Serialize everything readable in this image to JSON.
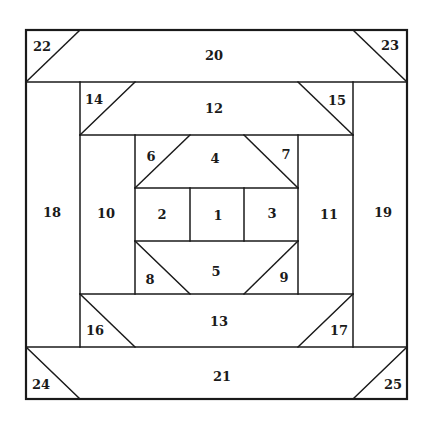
{
  "diagram": {
    "frame": {
      "x": 26,
      "y": 30,
      "width": 381,
      "height": 369
    },
    "colors": {
      "line": "#1a1a1a",
      "background": "#ffffff",
      "label": "#1a1a1a"
    },
    "grid": {
      "x": [
        26,
        80,
        135,
        190,
        244,
        298,
        353,
        407
      ],
      "y": [
        30,
        82,
        135,
        188,
        241,
        294,
        347,
        399
      ]
    },
    "lines": [
      {
        "id": "h-row1",
        "x1": 26,
        "y1": 82,
        "x2": 407,
        "y2": 82
      },
      {
        "id": "h-row2",
        "x1": 80,
        "y1": 135,
        "x2": 353,
        "y2": 135
      },
      {
        "id": "h-row3",
        "x1": 135,
        "y1": 188,
        "x2": 298,
        "y2": 188
      },
      {
        "id": "h-row4",
        "x1": 135,
        "y1": 241,
        "x2": 298,
        "y2": 241
      },
      {
        "id": "h-row5",
        "x1": 80,
        "y1": 294,
        "x2": 353,
        "y2": 294
      },
      {
        "id": "h-row6",
        "x1": 26,
        "y1": 347,
        "x2": 407,
        "y2": 347
      },
      {
        "id": "v-col1",
        "x1": 80,
        "y1": 82,
        "x2": 80,
        "y2": 347
      },
      {
        "id": "v-col2",
        "x1": 135,
        "y1": 135,
        "x2": 135,
        "y2": 294
      },
      {
        "id": "v-col3",
        "x1": 190,
        "y1": 188,
        "x2": 190,
        "y2": 241
      },
      {
        "id": "v-col4",
        "x1": 244,
        "y1": 188,
        "x2": 244,
        "y2": 241
      },
      {
        "id": "v-col5",
        "x1": 298,
        "y1": 135,
        "x2": 298,
        "y2": 294
      },
      {
        "id": "v-col6",
        "x1": 353,
        "y1": 82,
        "x2": 353,
        "y2": 347
      },
      {
        "id": "diag-22",
        "x1": 26,
        "y1": 82,
        "x2": 80,
        "y2": 30
      },
      {
        "id": "diag-23",
        "x1": 353,
        "y1": 30,
        "x2": 407,
        "y2": 82
      },
      {
        "id": "diag-14",
        "x1": 80,
        "y1": 135,
        "x2": 135,
        "y2": 82
      },
      {
        "id": "diag-15",
        "x1": 298,
        "y1": 82,
        "x2": 353,
        "y2": 135
      },
      {
        "id": "diag-6",
        "x1": 135,
        "y1": 188,
        "x2": 190,
        "y2": 135
      },
      {
        "id": "diag-7",
        "x1": 244,
        "y1": 135,
        "x2": 298,
        "y2": 188
      },
      {
        "id": "diag-8",
        "x1": 135,
        "y1": 241,
        "x2": 190,
        "y2": 294
      },
      {
        "id": "diag-9",
        "x1": 244,
        "y1": 294,
        "x2": 298,
        "y2": 241
      },
      {
        "id": "diag-16",
        "x1": 80,
        "y1": 294,
        "x2": 135,
        "y2": 347
      },
      {
        "id": "diag-17",
        "x1": 298,
        "y1": 347,
        "x2": 353,
        "y2": 294
      },
      {
        "id": "diag-24",
        "x1": 26,
        "y1": 347,
        "x2": 80,
        "y2": 399
      },
      {
        "id": "diag-25",
        "x1": 353,
        "y1": 399,
        "x2": 407,
        "y2": 347
      }
    ],
    "pieces": [
      {
        "label": "1",
        "x": 218,
        "y": 215
      },
      {
        "label": "2",
        "x": 162,
        "y": 214
      },
      {
        "label": "3",
        "x": 272,
        "y": 213
      },
      {
        "label": "4",
        "x": 215,
        "y": 158
      },
      {
        "label": "5",
        "x": 216,
        "y": 271
      },
      {
        "label": "6",
        "x": 151,
        "y": 156
      },
      {
        "label": "7",
        "x": 286,
        "y": 154
      },
      {
        "label": "8",
        "x": 150,
        "y": 279
      },
      {
        "label": "9",
        "x": 284,
        "y": 277
      },
      {
        "label": "10",
        "x": 106,
        "y": 213
      },
      {
        "label": "11",
        "x": 329,
        "y": 214
      },
      {
        "label": "12",
        "x": 214,
        "y": 108
      },
      {
        "label": "13",
        "x": 219,
        "y": 321
      },
      {
        "label": "14",
        "x": 94,
        "y": 99
      },
      {
        "label": "15",
        "x": 337,
        "y": 100
      },
      {
        "label": "16",
        "x": 95,
        "y": 330
      },
      {
        "label": "17",
        "x": 339,
        "y": 330
      },
      {
        "label": "18",
        "x": 52,
        "y": 212
      },
      {
        "label": "19",
        "x": 383,
        "y": 212
      },
      {
        "label": "20",
        "x": 214,
        "y": 55
      },
      {
        "label": "21",
        "x": 222,
        "y": 376
      },
      {
        "label": "22",
        "x": 42,
        "y": 46
      },
      {
        "label": "23",
        "x": 390,
        "y": 45
      },
      {
        "label": "24",
        "x": 41,
        "y": 384
      },
      {
        "label": "25",
        "x": 393,
        "y": 384
      }
    ]
  }
}
